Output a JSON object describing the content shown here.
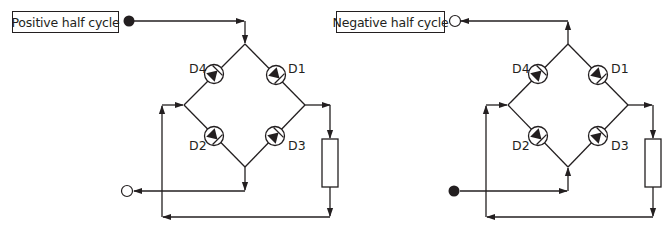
{
  "diagram": {
    "colors": {
      "ink": "#231f20",
      "background": "#ffffff"
    },
    "panels": [
      {
        "id": "positive",
        "label": "Positive half cycle",
        "input_terminal": "filled-circle",
        "output_terminal": "open-circle",
        "diodes": [
          "D4",
          "D1",
          "D2",
          "D3"
        ],
        "components": [
          "bridge",
          "load-resistor"
        ]
      },
      {
        "id": "negative",
        "label": "Negative half cycle",
        "input_terminal": "filled-circle",
        "output_terminal": "open-circle",
        "diodes": [
          "D4",
          "D1",
          "D2",
          "D3"
        ],
        "components": [
          "bridge",
          "load-resistor"
        ]
      }
    ]
  }
}
